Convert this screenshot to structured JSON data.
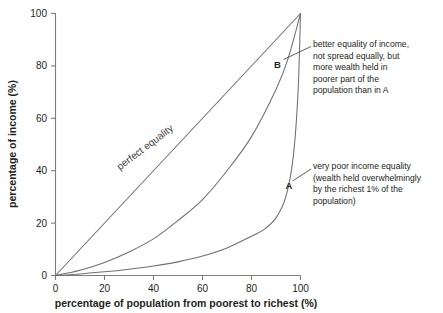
{
  "chart_data": {
    "type": "line",
    "title": "",
    "xlabel": "percentage of population from poorest to richest (%)",
    "ylabel": "percentage of income (%)",
    "xlim": [
      0,
      100
    ],
    "ylim": [
      0,
      100
    ],
    "xticks": [
      "0",
      "20",
      "40",
      "60",
      "80",
      "100"
    ],
    "yticks": [
      "0",
      "20",
      "40",
      "60",
      "80",
      "100"
    ],
    "grid": false,
    "legend": "none",
    "series": [
      {
        "name": "perfect equality",
        "inline_label": "perfect equality",
        "x": [
          0,
          10,
          20,
          30,
          40,
          50,
          60,
          70,
          80,
          90,
          100
        ],
        "values": [
          0,
          10,
          20,
          30,
          40,
          50,
          60,
          70,
          80,
          90,
          100
        ]
      },
      {
        "name": "B",
        "point_label": "B",
        "x": [
          0,
          10,
          20,
          30,
          40,
          50,
          60,
          70,
          80,
          90,
          95,
          100
        ],
        "values": [
          0,
          2,
          5,
          9,
          14,
          21,
          29,
          40,
          53,
          71,
          83,
          100
        ]
      },
      {
        "name": "A",
        "point_label": "A",
        "x": [
          0,
          10,
          20,
          30,
          40,
          50,
          60,
          70,
          80,
          85,
          90,
          94,
          97,
          99,
          100
        ],
        "values": [
          0,
          0.6,
          1.4,
          2.4,
          3.6,
          5.2,
          7.4,
          10.5,
          15,
          17.5,
          22,
          30,
          45,
          70,
          100
        ]
      }
    ],
    "annotations": [
      {
        "id": "B",
        "text": "better equality of income,\nnot spread equally, but\nmore wealth held in\npoorer part of the\npopulation than in A"
      },
      {
        "id": "A",
        "text": "very poor income equality\n(wealth held overwhelmingly\nby the richest 1% of the\npopulation)"
      }
    ],
    "colors": {
      "background": "#ffffff",
      "curve": "#6f6f6f",
      "axis": "#7d7d7d",
      "text": "#231f20"
    }
  }
}
